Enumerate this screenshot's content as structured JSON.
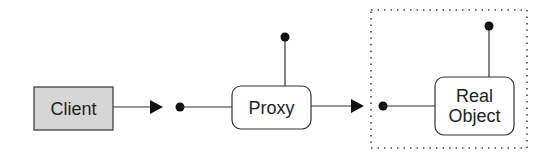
{
  "diagram": {
    "nodes": {
      "client": {
        "label": "Client",
        "fill": "#d6d6d6"
      },
      "proxy": {
        "label": "Proxy",
        "fill": "#ffffff"
      },
      "real_object": {
        "label_line1": "Real",
        "label_line2": "Object",
        "fill": "#ffffff"
      }
    },
    "edges": [
      {
        "from": "client",
        "to": "proxy",
        "style": "arrow-to-interface"
      },
      {
        "from": "proxy",
        "to": "real_object",
        "style": "arrow-to-interface"
      }
    ],
    "boundary": {
      "contains": "real_object",
      "style": "dotted"
    },
    "colors": {
      "stroke": "#333333",
      "dot": "#111111"
    }
  }
}
